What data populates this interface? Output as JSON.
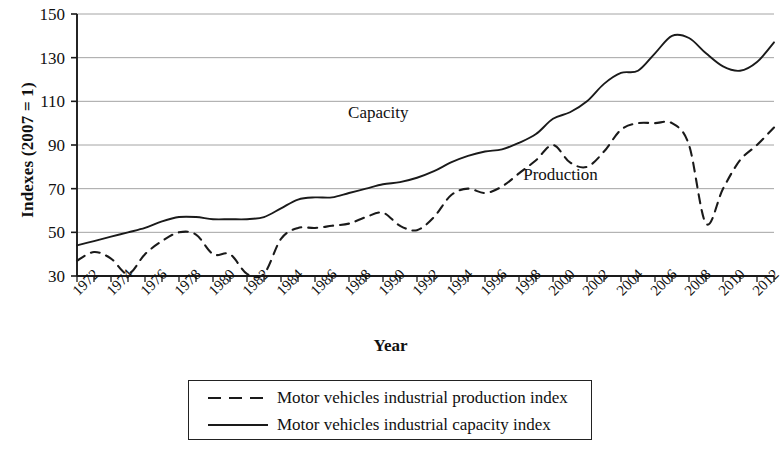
{
  "chart_data": {
    "type": "line",
    "title": "",
    "xlabel": "Year",
    "ylabel": "Indexes (2007 = 1)",
    "xlim": [
      1972,
      2013
    ],
    "ylim": [
      30,
      150
    ],
    "yticks": [
      30,
      50,
      70,
      90,
      110,
      130,
      150
    ],
    "grid": true,
    "grid_axis": "y",
    "legend_position": "below-plot",
    "x": [
      1972,
      1973,
      1974,
      1975,
      1976,
      1977,
      1978,
      1979,
      1980,
      1981,
      1982,
      1983,
      1984,
      1985,
      1986,
      1987,
      1988,
      1989,
      1990,
      1991,
      1992,
      1993,
      1994,
      1995,
      1996,
      1997,
      1998,
      1999,
      2000,
      2001,
      2002,
      2003,
      2004,
      2005,
      2006,
      2007,
      2008,
      2009,
      2010,
      2011,
      2012,
      2013
    ],
    "xtick_labels": [
      "1972",
      "1974",
      "1976",
      "1978",
      "1980",
      "1982",
      "1984",
      "1986",
      "1988",
      "1990",
      "1992",
      "1994",
      "1996",
      "1998",
      "2000",
      "2002",
      "2004",
      "2006",
      "2008",
      "2010",
      "2012"
    ],
    "series": [
      {
        "name": "Motor vehicles industrial production index",
        "style": "dashed",
        "color": "#1a1a1a",
        "values": [
          37,
          41,
          38,
          31,
          40,
          46,
          50,
          49,
          40,
          40,
          31,
          31,
          47,
          52,
          52,
          53,
          54,
          57,
          59,
          53,
          51,
          57,
          67,
          70,
          68,
          71,
          77,
          83,
          90,
          82,
          80,
          87,
          97,
          100,
          100,
          100,
          90,
          54,
          70,
          83,
          90,
          98
        ]
      },
      {
        "name": "Motor vehicles industrial capacity index",
        "style": "solid",
        "color": "#1a1a1a",
        "values": [
          44,
          46,
          48,
          50,
          52,
          55,
          57,
          57,
          56,
          56,
          56,
          57,
          61,
          65,
          66,
          66,
          68,
          70,
          72,
          73,
          75,
          78,
          82,
          85,
          87,
          88,
          91,
          95,
          102,
          105,
          110,
          118,
          123,
          124,
          132,
          140,
          139,
          132,
          126,
          124,
          128,
          137
        ]
      }
    ],
    "annotations": [
      {
        "text": "Capacity",
        "x": 1990.3,
        "y": 104
      },
      {
        "text": "Production",
        "x": 2000.6,
        "y": 76
      }
    ]
  },
  "legend": {
    "items": [
      {
        "label": "Motor vehicles industrial production index",
        "style": "dashed"
      },
      {
        "label": "Motor vehicles industrial capacity index",
        "style": "solid"
      }
    ]
  }
}
